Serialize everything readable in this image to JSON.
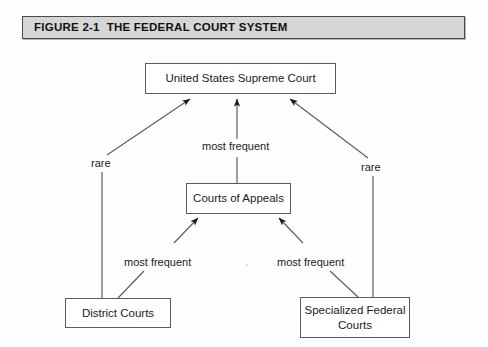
{
  "figure": {
    "title": "FIGURE 2-1  THE FEDERAL COURT SYSTEM",
    "title_bar_color": "#d6d6d6",
    "border_color": "#4a4a4a",
    "page_background": "#fefefe"
  },
  "diagram": {
    "type": "hierarchy-flow",
    "nodes": [
      {
        "id": "supreme",
        "label": "United States Supreme Court",
        "level": 1
      },
      {
        "id": "appeals",
        "label": "Courts of Appeals",
        "level": 2
      },
      {
        "id": "district",
        "label": "District Courts",
        "level": 3
      },
      {
        "id": "special",
        "label": "Specialized Federal Courts",
        "level": 3
      }
    ],
    "edges": [
      {
        "id": "district-to-supreme",
        "from": "district",
        "to": "supreme",
        "label": "rare",
        "style": "arrow-diagonal-up-right"
      },
      {
        "id": "appeals-to-supreme",
        "from": "appeals",
        "to": "supreme",
        "label": "most frequent",
        "style": "arrow-vertical-up"
      },
      {
        "id": "special-to-supreme",
        "from": "special",
        "to": "supreme",
        "label": "rare",
        "style": "arrow-diagonal-up-left"
      },
      {
        "id": "district-to-appeals",
        "from": "district",
        "to": "appeals",
        "label": "most frequent",
        "style": "arrow-diagonal-up-right"
      },
      {
        "id": "special-to-appeals",
        "from": "special",
        "to": "appeals",
        "label": "most frequent",
        "style": "arrow-diagonal-up-left"
      }
    ],
    "labels": {
      "rare_left": "rare",
      "rare_right": "rare",
      "most_frequent_top": "most frequent",
      "most_frequent_bottom_left": "most frequent",
      "most_frequent_bottom_right": "most frequent"
    }
  }
}
